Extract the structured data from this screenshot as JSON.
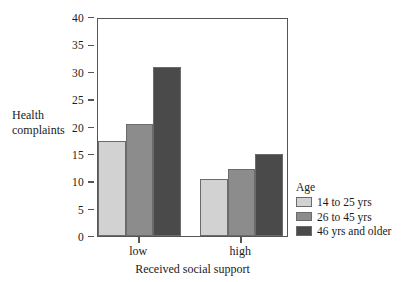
{
  "chart_data": {
    "type": "bar",
    "title": "",
    "xlabel": "Received social support",
    "ylabel": "Health complaints",
    "ylim": [
      0,
      40
    ],
    "yticks": [
      0,
      5,
      10,
      15,
      20,
      25,
      30,
      35,
      40
    ],
    "ytick_labels": [
      "0",
      "5",
      "10",
      "15",
      "20",
      "25",
      "30",
      "35",
      "40"
    ],
    "grid": false,
    "legend_position": "right",
    "legend_title": "Age",
    "categories": [
      "low",
      "high"
    ],
    "series": [
      {
        "name": "14 to 25 yrs",
        "color": "#d2d2d2",
        "values": [
          17.4,
          10.4
        ]
      },
      {
        "name": "26 to 45 yrs",
        "color": "#8c8c8c",
        "values": [
          20.4,
          12.3
        ]
      },
      {
        "name": "46 yrs and older",
        "color": "#4a4a4a",
        "values": [
          30.8,
          14.9
        ]
      }
    ]
  },
  "axes": {
    "y_title_line1": "Health",
    "y_title_line2": "complaints"
  }
}
